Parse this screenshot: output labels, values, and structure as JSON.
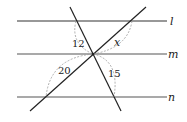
{
  "diagram": {
    "type": "parallel-lines-with-transversals",
    "parallel_lines": [
      {
        "name": "l",
        "y": 21
      },
      {
        "name": "m",
        "y": 54
      },
      {
        "name": "n",
        "y": 97
      }
    ],
    "transversals": [
      {
        "id": "steep",
        "from": [
          70,
          7
        ],
        "to": [
          121,
          111
        ]
      },
      {
        "id": "diagonal",
        "from": [
          30,
          111
        ],
        "to": [
          146,
          7
        ]
      }
    ],
    "segment_labels": {
      "top_left": "12",
      "top_right": "x",
      "bottom_left": "20",
      "bottom_right": "15"
    },
    "colors": {
      "line": "#333333",
      "dashed": "#999999"
    }
  }
}
